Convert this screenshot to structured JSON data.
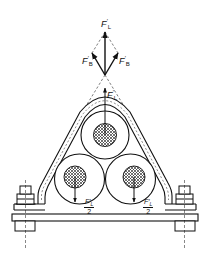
{
  "figure": {
    "labels": {
      "lift_force_top": "F",
      "lift_force_top_sub": "L",
      "lift_force_top_prime": "′",
      "bundle_force_left": "F",
      "bundle_force_left_sub": "B",
      "bundle_force_left_prime": "′",
      "bundle_force_right": "F",
      "bundle_force_right_sub": "B",
      "bundle_force_right_prime": "′",
      "lift_force_inner": "F",
      "lift_force_inner_sub": "L",
      "lift_force_inner_prime": "′",
      "half_force_left_num": "F′",
      "half_force_left_num_sub": "L",
      "half_force_left_den": "2",
      "half_force_right_num": "F′",
      "half_force_right_num_sub": "L",
      "half_force_right_den": "2"
    },
    "components": [
      "top cable",
      "bottom-left cable",
      "bottom-right cable",
      "strap clamp",
      "base plate",
      "left bolt",
      "right bolt"
    ],
    "colors": {
      "line": "#111111",
      "background": "#ffffff",
      "hatch": "#333333"
    }
  }
}
